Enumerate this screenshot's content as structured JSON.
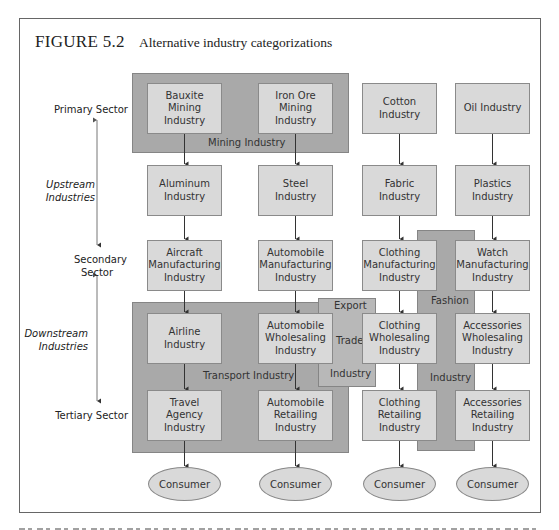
{
  "figure": {
    "number": "FIGURE 5.2",
    "caption": "Alternative industry categorizations"
  },
  "side_labels": {
    "primary": "Primary Sector",
    "upstream": "Upstream Industries",
    "secondary": "Secondary Sector",
    "downstream": "Downstream Industries",
    "tertiary": "Tertiary Sector"
  },
  "groups": {
    "mining": "Mining Industry",
    "transport": "Transport Industry",
    "export_trade": [
      "Export",
      "Trade",
      "Industry"
    ],
    "fashion": [
      "Fashion",
      "Industry"
    ]
  },
  "columns": [
    {
      "name": "aircraft-chain",
      "nodes": [
        "Bauxite Mining Industry",
        "Aluminum Industry",
        "Aircraft Manufacturing Industry",
        "Airline Industry",
        "Travel Agency Industry"
      ],
      "end": "Consumer"
    },
    {
      "name": "automobile-chain",
      "nodes": [
        "Iron Ore Mining Industry",
        "Steel Industry",
        "Automobile Manufacturing Industry",
        "Automobile Wholesaling Industry",
        "Automobile Retailing Industry"
      ],
      "end": "Consumer"
    },
    {
      "name": "clothing-chain",
      "nodes": [
        "Cotton Industry",
        "Fabric Industry",
        "Clothing Manufacturing Industry",
        "Clothing Wholesaling Industry",
        "Clothing Retailing Industry"
      ],
      "end": "Consumer"
    },
    {
      "name": "accessories-chain",
      "nodes": [
        "Oil Industry",
        "Plastics Industry",
        "Watch Manufacturing Industry",
        "Accessories Wholesaling Industry",
        "Accessories Retailing Industry"
      ],
      "end": "Consumer"
    }
  ],
  "colors": {
    "node_fill": "#d9d9d9",
    "group_fill": "#a9a9a9",
    "border": "#8a8a8a"
  }
}
